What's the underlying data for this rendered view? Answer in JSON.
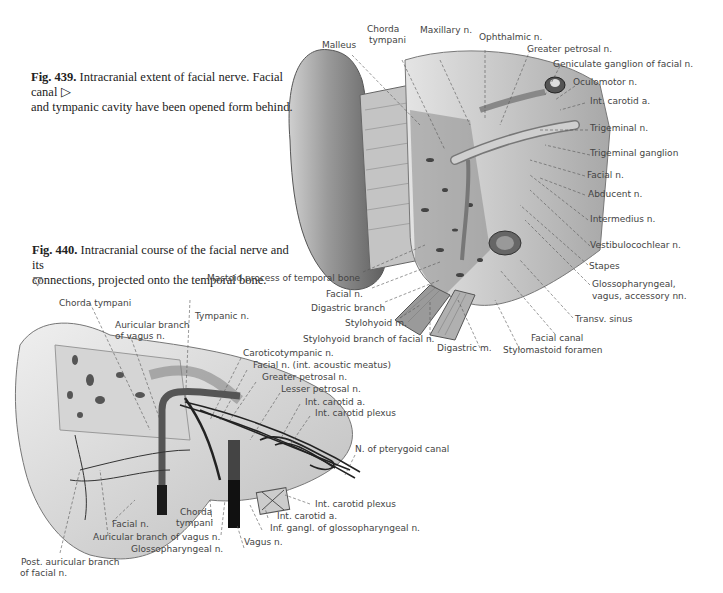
{
  "fig439": {
    "number": "Fig. 439.",
    "caption_line1": "Intracranial extent of facial nerve. Facial canal",
    "caption_line2": "and tympanic cavity have been opened form behind.",
    "pointer": "▷",
    "labels": {
      "malleus": "Malleus",
      "chorda_tympani_1": "Chorda",
      "chorda_tympani_2": "tympani",
      "maxillary": "Maxillary n.",
      "ophthalmic": "Ophthalmic n.",
      "greater_petrosal": "Greater petrosal n.",
      "geniculate": "Geniculate ganglion of facial n.",
      "oculomotor": "Oculomotor n.",
      "int_carotid": "Int. carotid a.",
      "trigeminal_n": "Trigeminal n.",
      "trigeminal_ganglion": "Trigeminal ganglion",
      "facial_n_right": "Facial n.",
      "abducent": "Abducent n.",
      "intermedius": "Intermedius n.",
      "vestibulocochlear": "Vestibulocochlear n.",
      "stapes": "Stapes",
      "glosso_1": "Glossopharyngeal,",
      "glosso_2": "vagus, accessory nn.",
      "transv_sinus": "Transv. sinus",
      "facial_canal": "Facial canal",
      "stylomastoid": "Stylomastoid foramen",
      "digastric_m": "Digastric m.",
      "stylohyoid_branch": "Stylohyoid branch of facial n.",
      "stylohyoid_m": "Stylohyoid m.",
      "digastric_branch": "Digastric branch",
      "facial_n_left": "Facial n.",
      "mastoid": "Mastoid process of temporal bone"
    }
  },
  "fig440": {
    "number": "Fig. 440.",
    "caption_line1": "Intracranial course of the facial nerve and its",
    "caption_line2": "connections, projected onto the temporal bone.",
    "pointer": "▽",
    "labels": {
      "chorda_tympani": "Chorda tympani",
      "auricular_vagus_1": "Auricular branch",
      "auricular_vagus_2": "of vagus n.",
      "tympanic": "Tympanic n.",
      "caroticotympanic": "Caroticotympanic n.",
      "facial_iam": "Facial n. (int. acoustic meatus)",
      "greater_petrosal": "Greater petrosal n.",
      "lesser_petrosal": "Lesser petrosal n.",
      "int_carotid_a_top": "Int. carotid a.",
      "int_carotid_plexus_top": "Int. carotid plexus",
      "pterygoid": "N. of pterygoid canal",
      "int_carotid_plexus_bottom": "Int. carotid plexus",
      "int_carotid_a_bottom": "Int. carotid a.",
      "inf_gangl": "Inf. gangl. of glossopharyngeal n.",
      "vagus": "Vagus n.",
      "glossopharyngeal": "Glossopharyngeal n.",
      "auricular_vagus_bottom": "Auricular branch of vagus n.",
      "chorda_1": "Chorda",
      "chorda_2": "tympani",
      "facial_n": "Facial n.",
      "post_auricular_1": "Post. auricular branch",
      "post_auricular_2": "of facial n."
    }
  }
}
